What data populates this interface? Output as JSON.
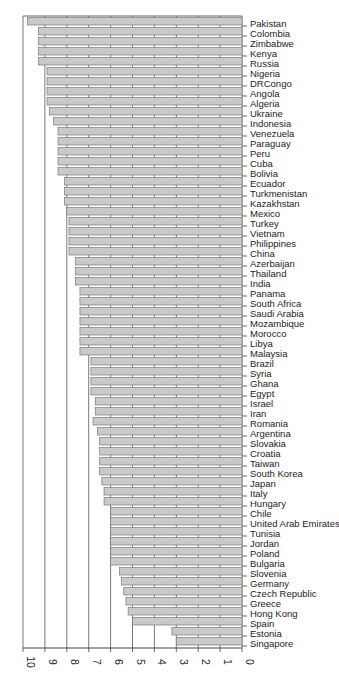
{
  "chart_data": {
    "type": "bar",
    "orientation": "horizontal-reversed-rotated",
    "title": "",
    "xlabel": "",
    "ylabel": "",
    "xlim": [
      0,
      10
    ],
    "ticks": [
      "10",
      "9",
      "8",
      "7",
      "6",
      "5",
      "4",
      "3",
      "2",
      "1",
      "0"
    ],
    "grid": true,
    "legend": null,
    "bar_color": "#c9c9c9",
    "bar_edge_color": "#7a7a7a",
    "categories": [
      "Pakistan",
      "Colombia",
      "Zimbabwe",
      "Kenya",
      "Russia",
      "Nigeria",
      "DRCongo",
      "Angola",
      "Algeria",
      "Ukraine",
      "Indonesia",
      "Venezuela",
      "Paraguay",
      "Peru",
      "Cuba",
      "Bolivia",
      "Ecuador",
      "Turkmenistan",
      "Kazakhstan",
      "Mexico",
      "Turkey",
      "Vietnam",
      "Philippines",
      "China",
      "Azerbaijan",
      "Thailand",
      "India",
      "Panama",
      "South Africa",
      "Saudi Arabia",
      "Mozambique",
      "Morocco",
      "Libya",
      "Malaysia",
      "Brazil",
      "Syria",
      "Ghana",
      "Egypt",
      "Israel",
      "Iran",
      "Romania",
      "Argentina",
      "Slovakia",
      "Croatia",
      "Taiwan",
      "South Korea",
      "Japan",
      "Italy",
      "Hungary",
      "Chile",
      "United Arab Emirates",
      "Tunisia",
      "Jordan",
      "Poland",
      "Bulgaria",
      "Slovenia",
      "Germany",
      "Czech Republic",
      "Greece",
      "Hong Kong",
      "Spain",
      "Estonia",
      "Singapore"
    ],
    "values": [
      9.8,
      9.3,
      9.3,
      9.3,
      9.3,
      8.9,
      8.9,
      8.9,
      8.9,
      8.8,
      8.6,
      8.4,
      8.4,
      8.4,
      8.4,
      8.4,
      8.1,
      8.1,
      8.1,
      8.0,
      7.9,
      7.9,
      7.9,
      7.9,
      7.6,
      7.6,
      7.6,
      7.4,
      7.4,
      7.4,
      7.4,
      7.4,
      7.4,
      7.4,
      6.9,
      6.9,
      6.9,
      6.9,
      6.7,
      6.7,
      6.8,
      6.6,
      6.5,
      6.5,
      6.5,
      6.5,
      6.4,
      6.3,
      6.3,
      6.0,
      6.0,
      6.0,
      6.0,
      6.0,
      6.0,
      5.6,
      5.5,
      5.4,
      5.3,
      5.2,
      5.0,
      3.2,
      3.0
    ]
  }
}
